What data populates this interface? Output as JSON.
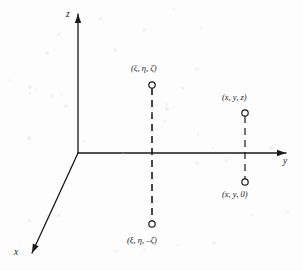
{
  "figure": {
    "background_color": "#fdfdfd",
    "ink_color": "#1a1a1a",
    "width": 303,
    "height": 271,
    "origin": {
      "x": 78,
      "y": 153
    }
  },
  "axes": [
    {
      "name": "z-axis",
      "label": "z",
      "direction": "up",
      "from": {
        "x": 78,
        "y": 153
      },
      "to": {
        "x": 78,
        "y": 14
      },
      "label_pos": {
        "x": 66,
        "y": 10
      },
      "arrow": true
    },
    {
      "name": "y-axis",
      "label": "y",
      "direction": "right",
      "from": {
        "x": 78,
        "y": 153
      },
      "to": {
        "x": 286,
        "y": 153
      },
      "label_pos": {
        "x": 283,
        "y": 157
      },
      "arrow": true
    },
    {
      "name": "x-axis",
      "label": "x",
      "direction": "down-left",
      "from": {
        "x": 78,
        "y": 153
      },
      "to": {
        "x": 32,
        "y": 253
      },
      "label_pos": {
        "x": 14,
        "y": 248
      },
      "arrow": true
    }
  ],
  "points": [
    {
      "name": "point-xi-eta-zeta",
      "label": "(ξ, η, ζ)",
      "marker": {
        "x": 152,
        "y": 85,
        "r": 3.2
      },
      "label_pos": {
        "x": 131,
        "y": 64
      },
      "label_anchor": "start"
    },
    {
      "name": "point-xi-eta-neg-zeta",
      "label": "(ξ, η, –ζ)",
      "marker": {
        "x": 152,
        "y": 224,
        "r": 3.2
      },
      "label_pos": {
        "x": 127,
        "y": 236
      },
      "label_anchor": "start"
    },
    {
      "name": "point-x-y-z",
      "label": "(x, y, z)",
      "marker": {
        "x": 245,
        "y": 113,
        "r": 3.2
      },
      "label_pos": {
        "x": 222,
        "y": 93
      },
      "label_anchor": "start"
    },
    {
      "name": "point-x-y-zero",
      "label": "(x, y, 0)",
      "marker": {
        "x": 245,
        "y": 182,
        "r": 3.2
      },
      "label_pos": {
        "x": 222,
        "y": 190
      },
      "label_anchor": "start"
    }
  ],
  "connectors": [
    {
      "name": "dashed-line-mirror-pair",
      "style": "dashed",
      "from": {
        "x": 152,
        "y": 88
      },
      "to": {
        "x": 152,
        "y": 221
      },
      "dash_pattern": "7,5",
      "width": 1.6
    },
    {
      "name": "dashed-line-xyz-to-xy0",
      "style": "dashed",
      "from": {
        "x": 245,
        "y": 116
      },
      "to": {
        "x": 245,
        "y": 179
      },
      "dash_pattern": "7,5",
      "width": 1.2
    }
  ]
}
